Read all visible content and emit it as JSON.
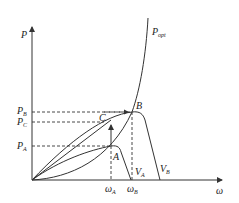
{
  "diagram": {
    "axes": {
      "y_label": "P",
      "x_label": "ω"
    },
    "curves": {
      "optimal_power_curve": "P",
      "optimal_power_curve_sub": "opt",
      "curve_A_label": "V",
      "curve_A_sub": "A",
      "curve_B_label": "V",
      "curve_B_sub": "B"
    },
    "points": {
      "A": "A",
      "B": "B",
      "C": "C"
    },
    "y_ticks": [
      {
        "main": "P",
        "sub": "B"
      },
      {
        "main": "P",
        "sub": "C"
      },
      {
        "main": "P",
        "sub": "A"
      }
    ],
    "x_ticks": [
      {
        "main": "ω",
        "sub": "A"
      },
      {
        "main": "ω",
        "sub": "B"
      }
    ],
    "colors": {
      "line": "#333333",
      "background": "#ffffff"
    }
  }
}
